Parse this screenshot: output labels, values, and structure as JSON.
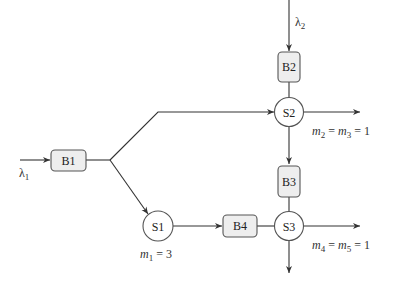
{
  "diagram": {
    "type": "queueing-network",
    "buffers": [
      {
        "id": "B1",
        "label": "B1"
      },
      {
        "id": "B2",
        "label": "B2"
      },
      {
        "id": "B3",
        "label": "B3"
      },
      {
        "id": "B4",
        "label": "B4"
      }
    ],
    "stations": [
      {
        "id": "S1",
        "label": "S1"
      },
      {
        "id": "S2",
        "label": "S2"
      },
      {
        "id": "S3",
        "label": "S3"
      }
    ],
    "arrival_labels": {
      "lambda1": "λ",
      "lambda1_sub": "1",
      "lambda2": "λ",
      "lambda2_sub": "2"
    },
    "server_labels": {
      "s1": {
        "m": "m",
        "sub": "1",
        "rest": " = 3"
      },
      "s2": {
        "m": "m",
        "sub": "2",
        "mid": " = ",
        "m2": "m",
        "sub2": "3",
        "rest": " = 1"
      },
      "s3": {
        "m": "m",
        "sub": "4",
        "mid": " = ",
        "m2": "m",
        "sub2": "5",
        "rest": " = 1"
      }
    },
    "edges": [
      {
        "from": "input-λ1",
        "to": "B1"
      },
      {
        "from": "B1",
        "to": "S2",
        "via": "upper-branch"
      },
      {
        "from": "B1",
        "to": "S1",
        "via": "lower-branch"
      },
      {
        "from": "input-λ2",
        "to": "B2"
      },
      {
        "from": "B2",
        "to": "S2"
      },
      {
        "from": "S2",
        "to": "output-right"
      },
      {
        "from": "S2",
        "to": "B3"
      },
      {
        "from": "B3",
        "to": "S3"
      },
      {
        "from": "S1",
        "to": "B4"
      },
      {
        "from": "B4",
        "to": "S3"
      },
      {
        "from": "S3",
        "to": "output-right"
      },
      {
        "from": "S3",
        "to": "output-down"
      }
    ]
  }
}
